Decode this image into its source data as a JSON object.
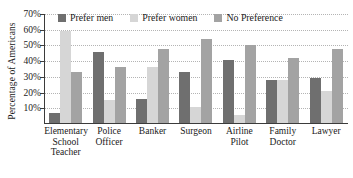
{
  "chart_data": {
    "type": "bar",
    "title": "",
    "xlabel": "",
    "ylabel": "Percentage of Americans",
    "ylim": [
      0,
      70
    ],
    "ytick_values": [
      10,
      20,
      30,
      40,
      50,
      60,
      70
    ],
    "ytick_labels": [
      "10%",
      "20%",
      "30%",
      "40%",
      "50%",
      "60%",
      "70%"
    ],
    "grid": true,
    "legend_position": "top-inside",
    "categories": [
      "Elementary School Teacher",
      "Police Officer",
      "Banker",
      "Surgeon",
      "Airline Pilot",
      "Family Doctor",
      "Lawyer"
    ],
    "category_lines": [
      [
        "Elementary",
        "School",
        "Teacher"
      ],
      [
        "Police",
        "Officer"
      ],
      [
        "Banker"
      ],
      [
        "Surgeon"
      ],
      [
        "Airline",
        "Pilot"
      ],
      [
        "Family",
        "Doctor"
      ],
      [
        "Lawyer"
      ]
    ],
    "series": [
      {
        "name": "Prefer men",
        "color": "#6f6f6f",
        "values": [
          7,
          46,
          16,
          33,
          41,
          28,
          29
        ]
      },
      {
        "name": "Prefer women",
        "color": "#d6d6d6",
        "values": [
          59,
          15,
          36,
          11,
          6,
          28,
          21
        ]
      },
      {
        "name": "No Preference",
        "color": "#a3a3a3",
        "values": [
          33,
          36,
          48,
          54,
          50,
          42,
          48
        ]
      }
    ]
  }
}
